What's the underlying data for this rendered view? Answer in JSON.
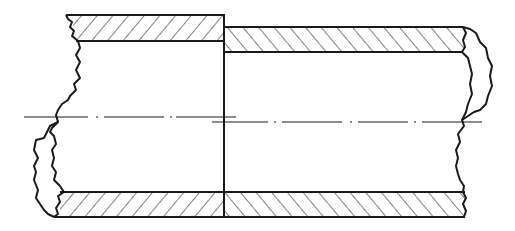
{
  "diagram": {
    "colors": {
      "line": "#1a1a1a",
      "background": "#ffffff",
      "hatch": "#1a1a1a"
    },
    "parts": [
      {
        "name": "left-tube-segment",
        "hatch_direction": "forward-slash"
      },
      {
        "name": "right-tube-segment",
        "hatch_direction": "back-slash"
      }
    ],
    "features": [
      "wall-hatching",
      "irregular-break-lines",
      "center-lines",
      "joint-line"
    ]
  }
}
